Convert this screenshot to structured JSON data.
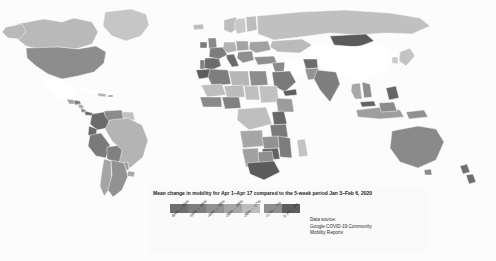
{
  "figure": {
    "kind": "world-choropleth-map",
    "background_color": "#ffffff",
    "map_background_color": "#fcfcfc",
    "no_data_color": "#ffffff",
    "border_color": "#ffffff"
  },
  "legend": {
    "title": "Mean change in mobility for Apr 1–Apr 17 compared to the 5-week period Jan 3–Feb 6, 2020",
    "swatches": [
      {
        "label": "-64% – -55%",
        "color": "#6e6e6e"
      },
      {
        "label": "-55% – -45%",
        "color": "#7e7e7e"
      },
      {
        "label": "-45% – -36%",
        "color": "#919191"
      },
      {
        "label": "-36% – -26%",
        "color": "#a6a6a6"
      },
      {
        "label": "-26% – -17%",
        "color": "#bdbdbd"
      },
      {
        "label": "-17% – -7%",
        "color": "#8f8f8f"
      },
      {
        "label": "0.1% – 4%",
        "color": "#5e5e5e"
      }
    ],
    "source_lines": [
      "Data source:",
      "Google COVID-19 Community",
      "Mobility Reports"
    ]
  },
  "chart_data": {
    "type": "heatmap",
    "title": "Mean change in mobility for Apr 1–Apr 17 compared to the 5-week period Jan 3–Feb 6, 2020",
    "xlabel": "",
    "ylabel": "",
    "legend_position": "bottom-center",
    "grid": false,
    "value_unit": "percent change in mobility",
    "bins": [
      {
        "range": [
          -64,
          -55
        ],
        "label": "-64% – -55%",
        "color": "#6e6e6e"
      },
      {
        "range": [
          -55,
          -45
        ],
        "label": "-55% – -45%",
        "color": "#7e7e7e"
      },
      {
        "range": [
          -45,
          -36
        ],
        "label": "-45% – -36%",
        "color": "#919191"
      },
      {
        "range": [
          -36,
          -26
        ],
        "label": "-36% – -26%",
        "color": "#a6a6a6"
      },
      {
        "range": [
          -26,
          -17
        ],
        "label": "-26% – -17%",
        "color": "#bdbdbd"
      },
      {
        "range": [
          -17,
          -7
        ],
        "label": "-17% – -7%",
        "color": "#8f8f8f"
      },
      {
        "range": [
          0.1,
          4
        ],
        "label": "0.1% – 4%",
        "color": "#5e5e5e"
      }
    ],
    "regions": [
      {
        "name": "United States",
        "bin": 2,
        "color": "#8d8d8d"
      },
      {
        "name": "Canada",
        "bin": 4,
        "color": "#b9b9b9"
      },
      {
        "name": "Greenland",
        "bin": 4,
        "color": "#c6c6c6"
      },
      {
        "name": "Mexico",
        "bin": null,
        "color": "#ffffff"
      },
      {
        "name": "Guatemala",
        "bin": 3,
        "color": "#a3a3a3"
      },
      {
        "name": "Honduras",
        "bin": 1,
        "color": "#7c7c7c"
      },
      {
        "name": "Nicaragua",
        "bin": 3,
        "color": "#a9a9a9"
      },
      {
        "name": "Costa Rica",
        "bin": 2,
        "color": "#909090"
      },
      {
        "name": "Panama",
        "bin": 0,
        "color": "#6d6d6d"
      },
      {
        "name": "Cuba",
        "bin": null,
        "color": "#ffffff"
      },
      {
        "name": "Colombia",
        "bin": 0,
        "color": "#6b6b6b"
      },
      {
        "name": "Venezuela",
        "bin": 2,
        "color": "#8c8c8c"
      },
      {
        "name": "Ecuador",
        "bin": 0,
        "color": "#6a6a6a"
      },
      {
        "name": "Peru",
        "bin": 1,
        "color": "#7a7a7a"
      },
      {
        "name": "Bolivia",
        "bin": 1,
        "color": "#808080"
      },
      {
        "name": "Brazil",
        "bin": 4,
        "color": "#b4b4b4"
      },
      {
        "name": "Chile",
        "bin": 3,
        "color": "#a5a5a5"
      },
      {
        "name": "Argentina",
        "bin": 2,
        "color": "#929292"
      },
      {
        "name": "Paraguay",
        "bin": 3,
        "color": "#a0a0a0"
      },
      {
        "name": "Uruguay",
        "bin": 3,
        "color": "#a8a8a8"
      },
      {
        "name": "Guyana",
        "bin": 4,
        "color": "#c2c2c2"
      },
      {
        "name": "United Kingdom",
        "bin": 2,
        "color": "#8a8a8a"
      },
      {
        "name": "Ireland",
        "bin": 1,
        "color": "#7b7b7b"
      },
      {
        "name": "France",
        "bin": 1,
        "color": "#7d7d7d"
      },
      {
        "name": "Spain",
        "bin": 0,
        "color": "#6c6c6c"
      },
      {
        "name": "Portugal",
        "bin": 1,
        "color": "#808080"
      },
      {
        "name": "Italy",
        "bin": 0,
        "color": "#6a6a6a"
      },
      {
        "name": "Germany",
        "bin": 4,
        "color": "#b2b2b2"
      },
      {
        "name": "Poland",
        "bin": 3,
        "color": "#a4a4a4"
      },
      {
        "name": "Norway",
        "bin": 4,
        "color": "#bdbdbd"
      },
      {
        "name": "Sweden",
        "bin": 5,
        "color": "#c9c9c9"
      },
      {
        "name": "Finland",
        "bin": 4,
        "color": "#bcbcbc"
      },
      {
        "name": "Russia",
        "bin": 4,
        "color": "#c0c0c0"
      },
      {
        "name": "Ukraine",
        "bin": 3,
        "color": "#a2a2a2"
      },
      {
        "name": "Turkey",
        "bin": 2,
        "color": "#8f8f8f"
      },
      {
        "name": "Kazakhstan",
        "bin": 4,
        "color": "#bababa"
      },
      {
        "name": "Mongolia",
        "bin": 0,
        "color": "#5a5a5a"
      },
      {
        "name": "China",
        "bin": null,
        "color": "#ffffff"
      },
      {
        "name": "India",
        "bin": 1,
        "color": "#7f7f7f"
      },
      {
        "name": "Pakistan",
        "bin": 2,
        "color": "#949494"
      },
      {
        "name": "Afghanistan",
        "bin": 0,
        "color": "#6d6d6d"
      },
      {
        "name": "Iran",
        "bin": null,
        "color": "#ffffff"
      },
      {
        "name": "Saudi Arabia",
        "bin": 1,
        "color": "#7a7a7a"
      },
      {
        "name": "Iraq",
        "bin": 2,
        "color": "#8b8b8b"
      },
      {
        "name": "Yemen",
        "bin": 0,
        "color": "#5e5e5e"
      },
      {
        "name": "Japan",
        "bin": 4,
        "color": "#c4c4c4"
      },
      {
        "name": "South Korea",
        "bin": 5,
        "color": "#cbcbcb"
      },
      {
        "name": "Thailand",
        "bin": 3,
        "color": "#a7a7a7"
      },
      {
        "name": "Vietnam",
        "bin": 2,
        "color": "#8e8e8e"
      },
      {
        "name": "Philippines",
        "bin": 0,
        "color": "#666666"
      },
      {
        "name": "Indonesia",
        "bin": 3,
        "color": "#9e9e9e"
      },
      {
        "name": "Malaysia",
        "bin": 0,
        "color": "#646464"
      },
      {
        "name": "Australia",
        "bin": 2,
        "color": "#8a8a8a"
      },
      {
        "name": "New Zealand",
        "bin": 0,
        "color": "#6f6f6f"
      },
      {
        "name": "Papua New Guinea",
        "bin": 2,
        "color": "#909090"
      },
      {
        "name": "Egypt",
        "bin": 2,
        "color": "#8d8d8d"
      },
      {
        "name": "Libya",
        "bin": 4,
        "color": "#b6b6b6"
      },
      {
        "name": "Algeria",
        "bin": 1,
        "color": "#7e7e7e"
      },
      {
        "name": "Morocco",
        "bin": 0,
        "color": "#5c5c5c"
      },
      {
        "name": "Mali",
        "bin": 4,
        "color": "#bebebe"
      },
      {
        "name": "Niger",
        "bin": 4,
        "color": "#bbbbbb"
      },
      {
        "name": "Nigeria",
        "bin": 1,
        "color": "#818181"
      },
      {
        "name": "Sudan",
        "bin": 4,
        "color": "#c1c1c1"
      },
      {
        "name": "Ethiopia",
        "bin": 3,
        "color": "#9c9c9c"
      },
      {
        "name": "Kenya",
        "bin": 0,
        "color": "#676767"
      },
      {
        "name": "Tanzania",
        "bin": 1,
        "color": "#7a7a7a"
      },
      {
        "name": "Angola",
        "bin": 3,
        "color": "#a6a6a6"
      },
      {
        "name": "Zambia",
        "bin": 2,
        "color": "#929292"
      },
      {
        "name": "Zimbabwe",
        "bin": 0,
        "color": "#636363"
      },
      {
        "name": "Mozambique",
        "bin": 1,
        "color": "#7c7c7c"
      },
      {
        "name": "South Africa",
        "bin": 0,
        "color": "#5b5b5b"
      },
      {
        "name": "Namibia",
        "bin": 3,
        "color": "#a0a0a0"
      },
      {
        "name": "Botswana",
        "bin": 2,
        "color": "#8f8f8f"
      },
      {
        "name": "Madagascar",
        "bin": 4,
        "color": "#c3c3c3"
      },
      {
        "name": "Chad",
        "bin": 4,
        "color": "#c0c0c0"
      },
      {
        "name": "Democratic Republic of the Congo",
        "bin": 4,
        "color": "#bfbfbf"
      }
    ]
  }
}
